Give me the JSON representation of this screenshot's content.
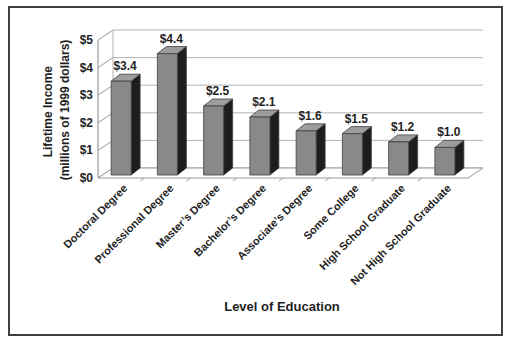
{
  "figure_type": "scanned textbook bar chart",
  "chart_data": {
    "type": "bar",
    "categories": [
      "Doctoral Degree",
      "Professional Degree",
      "Master’s Degree",
      "Bachelor’s Degree",
      "Associate’s Degree",
      "Some College",
      "High School Graduate",
      "Not High School Graduate"
    ],
    "values": [
      3.4,
      4.4,
      2.5,
      2.1,
      1.6,
      1.5,
      1.2,
      1.0
    ],
    "data_labels": [
      "$3.4",
      "$4.4",
      "$2.5",
      "$2.1",
      "$1.6",
      "$1.5",
      "$1.2",
      "$1.0"
    ],
    "title": "",
    "xlabel": "Level of Education",
    "ylabel": "Lifetime Income (millions of 1999 dollars)",
    "ylabel_lines": [
      "Lifetime Income",
      "(millions of 1999 dollars)"
    ],
    "ylim": [
      0,
      5
    ],
    "ytick_labels": [
      "$0",
      "$1",
      "$2",
      "$3",
      "$4",
      "$5"
    ],
    "grid": true,
    "legend": "none",
    "style": {
      "bar_front": "#898989",
      "bar_top": "#9d9d9d",
      "bar_side": "#1d1d1d",
      "bar_outline": "#404040",
      "grid_line": "#b3b3b3",
      "axis_line": "#9a9a9a",
      "text": "#1f1f1f",
      "frame_border": "#3f3f3f",
      "background": "#ffffff"
    }
  }
}
